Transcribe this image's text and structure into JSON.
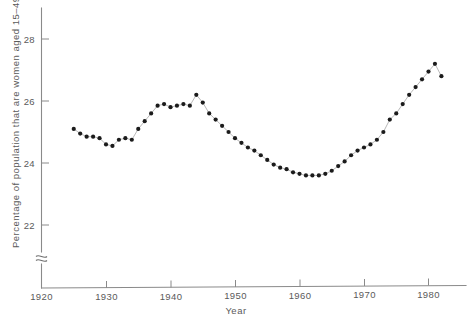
{
  "chart_data": {
    "type": "scatter",
    "title": "",
    "xlabel": "Year",
    "ylabel": "Percentage of population that are women aged 15–49",
    "xlim": [
      1920,
      1986
    ],
    "ylim": [
      21.3,
      29.0
    ],
    "xticks": [
      1920,
      1930,
      1940,
      1950,
      1960,
      1970,
      1980
    ],
    "yticks": [
      22,
      24,
      26,
      28
    ],
    "grid": false,
    "legend": null,
    "axis_break": {
      "axis": "y",
      "symbol": "squiggle",
      "note": "y-axis broken below lowest tick"
    },
    "series": [
      {
        "name": "Percentage of population that are women aged 15-49",
        "marker": "filled-circle",
        "x": [
          1925,
          1926,
          1927,
          1928,
          1929,
          1930,
          1931,
          1932,
          1933,
          1934,
          1935,
          1936,
          1937,
          1938,
          1939,
          1940,
          1941,
          1942,
          1943,
          1944,
          1945,
          1946,
          1947,
          1948,
          1949,
          1950,
          1951,
          1952,
          1953,
          1954,
          1955,
          1956,
          1957,
          1958,
          1959,
          1960,
          1961,
          1962,
          1963,
          1964,
          1965,
          1966,
          1967,
          1968,
          1969,
          1970,
          1971,
          1972,
          1973,
          1974,
          1975,
          1976,
          1977,
          1978,
          1979,
          1980,
          1981,
          1982
        ],
        "y": [
          25.1,
          24.95,
          24.85,
          24.85,
          24.8,
          24.6,
          24.55,
          24.75,
          24.8,
          24.75,
          25.1,
          25.35,
          25.6,
          25.85,
          25.9,
          25.8,
          25.85,
          25.9,
          25.85,
          26.2,
          25.95,
          25.6,
          25.4,
          25.2,
          25.0,
          24.8,
          24.65,
          24.5,
          24.4,
          24.25,
          24.1,
          23.95,
          23.85,
          23.8,
          23.7,
          23.65,
          23.6,
          23.6,
          23.6,
          23.65,
          23.75,
          23.9,
          24.05,
          24.25,
          24.4,
          24.5,
          24.6,
          24.75,
          25.0,
          25.4,
          25.6,
          25.9,
          26.2,
          26.45,
          26.7,
          26.95,
          27.2,
          26.8
        ]
      }
    ]
  },
  "axis": {
    "y_title": "Percentage of population that are women aged 15–49",
    "x_title": "Year",
    "y_tick_labels": [
      "28",
      "26",
      "24",
      "22"
    ],
    "x_tick_labels": [
      "1920",
      "1930",
      "1940",
      "1950",
      "1960",
      "1970",
      "1980"
    ]
  }
}
